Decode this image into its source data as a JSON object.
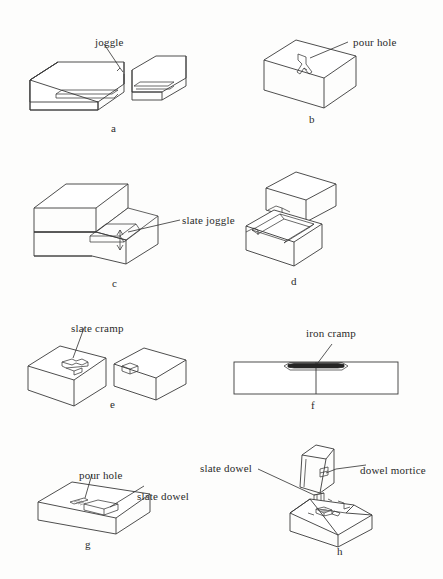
{
  "page": {
    "background_color": "#fdfdfc",
    "line_color": "#3a3a3a"
  },
  "figures": [
    {
      "id": "a",
      "caption": "a",
      "description": "Two isometric stone blocks facing each other, each with a horizontal slot cut in the facing end for a joggle",
      "labels": [
        {
          "name": "joggle-label",
          "text": "joggle"
        }
      ]
    },
    {
      "id": "b",
      "caption": "b",
      "description": "Single elongated block with a Y shaped pour channel cut into the top face",
      "labels": [
        {
          "name": "pour-hole-label",
          "text": "pour hole"
        }
      ]
    },
    {
      "id": "c",
      "caption": "c",
      "description": "Stepped pair of blocks, upper course set back, with a slate joggle plate in the groove at the step",
      "labels": [
        {
          "name": "slate-joggle-label",
          "text": "slate joggle"
        }
      ]
    },
    {
      "id": "d",
      "caption": "d",
      "description": "Exploded pair of blocks, upper block lifted above a lower block with a wide trough groove across its top bed",
      "labels": []
    },
    {
      "id": "e",
      "caption": "e",
      "description": "Two separated blocks, the left carrying a double dovetail slate cramp in a surface recess, the right with the matching socket",
      "labels": [
        {
          "name": "slate-cramp-label",
          "text": "slate cramp"
        }
      ]
    },
    {
      "id": "f",
      "caption": "f",
      "description": "Plan view of two stones meeting at a vertical joint with a dark iron cramp sunk in dovetailed recesses across the joint",
      "labels": [
        {
          "name": "iron-cramp-label",
          "text": "iron cramp"
        }
      ]
    },
    {
      "id": "g",
      "caption": "g",
      "description": "Low flat block in isometric with a slate dowel seated in a shallow mortice on the top bed and a small pour hole beside it",
      "labels": [
        {
          "name": "pour-hole-label",
          "text": "pour hole"
        },
        {
          "name": "slate-dowel-label",
          "text": "slate dowel"
        }
      ]
    },
    {
      "id": "h",
      "caption": "h",
      "description": "Exploded dowelled joint, upper stone raised above a lower block with a chamfered hipped top containing the dowel mortice",
      "labels": [
        {
          "name": "slate-dowel-label",
          "text": "slate dowel"
        },
        {
          "name": "dowel-mortice-label",
          "text": "dowel mortice"
        }
      ]
    }
  ]
}
